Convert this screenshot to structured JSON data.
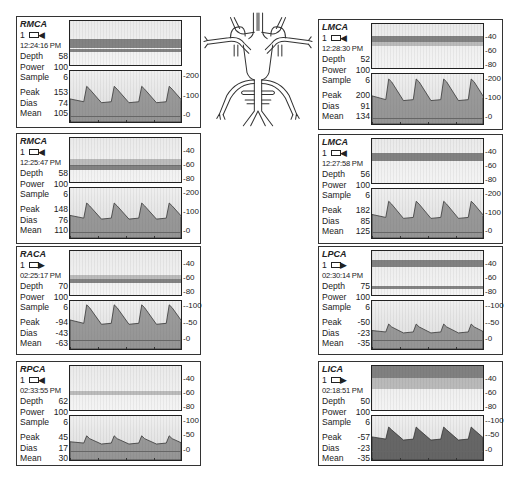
{
  "panels": [
    {
      "id": "rmca-1",
      "vessel": "RMCA",
      "channel": "1",
      "probe_direction": "toward",
      "time": "12:24:16 PM",
      "depth_label": "Depth",
      "depth": "58",
      "power_label": "Power",
      "power": "100",
      "sample_label": "Sample",
      "sample": "6",
      "peak_label": "Peak",
      "peak": "153",
      "dias_label": "Dias",
      "dias": "74",
      "mean_label": "Mean",
      "mean": "105",
      "depth_ticks": [],
      "velocity_ticks": [
        "200",
        "100",
        "0"
      ]
    },
    {
      "id": "rmca-2",
      "vessel": "RMCA",
      "channel": "1",
      "probe_direction": "toward",
      "time": "12:25:47 PM",
      "depth_label": "Depth",
      "depth": "58",
      "power_label": "Power",
      "power": "100",
      "sample_label": "Sample",
      "sample": "6",
      "peak_label": "Peak",
      "peak": "148",
      "dias_label": "Dias",
      "dias": "76",
      "mean_label": "Mean",
      "mean": "110",
      "depth_ticks": [
        "40",
        "60",
        "80"
      ],
      "velocity_ticks": [
        "200",
        "100",
        "0"
      ]
    },
    {
      "id": "raca",
      "vessel": "RACA",
      "channel": "1",
      "probe_direction": "away",
      "time": "02:25:17 PM",
      "depth_label": "Depth",
      "depth": "70",
      "power_label": "Power",
      "power": "100",
      "sample_label": "Sample",
      "sample": "6",
      "peak_label": "Peak",
      "peak": "-94",
      "dias_label": "Dias",
      "dias": "-43",
      "mean_label": "Mean",
      "mean": "-63",
      "depth_ticks": [
        "40",
        "60",
        "80"
      ],
      "velocity_ticks": [
        "-100",
        "-50",
        "0"
      ]
    },
    {
      "id": "rpca",
      "vessel": "RPCA",
      "channel": "1",
      "probe_direction": "toward",
      "time": "02:33:55 PM",
      "depth_label": "Depth",
      "depth": "62",
      "power_label": "Power",
      "power": "100",
      "sample_label": "Sample",
      "sample": "6",
      "peak_label": "Peak",
      "peak": "45",
      "dias_label": "Dias",
      "dias": "17",
      "mean_label": "Mean",
      "mean": "30",
      "depth_ticks": [
        "40",
        "60",
        "80"
      ],
      "velocity_ticks": [
        "100",
        "50",
        "0"
      ]
    },
    {
      "id": "lmca-1",
      "vessel": "LMCA",
      "channel": "1",
      "probe_direction": "toward",
      "time": "12:28:30 PM",
      "depth_label": "Depth",
      "depth": "52",
      "power_label": "Power",
      "power": "100",
      "sample_label": "Sample",
      "sample": "6",
      "peak_label": "Peak",
      "peak": "200",
      "dias_label": "Dias",
      "dias": "91",
      "mean_label": "Mean",
      "mean": "134",
      "depth_ticks": [
        "40",
        "60",
        "80"
      ],
      "velocity_ticks": [
        "200",
        "100",
        "0"
      ]
    },
    {
      "id": "lmca-2",
      "vessel": "LMCA",
      "channel": "1",
      "probe_direction": "toward",
      "time": "12:27:58 PM",
      "depth_label": "Depth",
      "depth": "56",
      "power_label": "Power",
      "power": "100",
      "sample_label": "Sample",
      "sample": "6",
      "peak_label": "Peak",
      "peak": "182",
      "dias_label": "Dias",
      "dias": "85",
      "mean_label": "Mean",
      "mean": "125",
      "depth_ticks": [
        "40",
        "60",
        "80"
      ],
      "velocity_ticks": [
        "200",
        "100",
        "0"
      ]
    },
    {
      "id": "lpca",
      "vessel": "LPCA",
      "channel": "1",
      "probe_direction": "away",
      "time": "02:30:14 PM",
      "depth_label": "Depth",
      "depth": "75",
      "power_label": "Power",
      "power": "100",
      "sample_label": "Sample",
      "sample": "6",
      "peak_label": "Peak",
      "peak": "-50",
      "dias_label": "Dias",
      "dias": "-23",
      "mean_label": "Mean",
      "mean": "-35",
      "depth_ticks": [
        "40",
        "60",
        "80"
      ],
      "velocity_ticks": [
        "-100",
        "-50",
        "0"
      ]
    },
    {
      "id": "lica",
      "vessel": "LICA",
      "channel": "1",
      "probe_direction": "away",
      "time": "02:18:51 PM",
      "depth_label": "Depth",
      "depth": "50",
      "power_label": "Power",
      "power": "100",
      "sample_label": "Sample",
      "sample": "6",
      "peak_label": "Peak",
      "peak": "-57",
      "dias_label": "Dias",
      "dias": "-23",
      "mean_label": "Mean",
      "mean": "-35",
      "depth_ticks": [
        "40",
        "60",
        "80"
      ],
      "velocity_ticks": [
        "-100",
        "-50",
        "0"
      ]
    }
  ],
  "diagram": {
    "name": "circle-of-willis"
  },
  "glyphs": {
    "arrow_toward": "◀",
    "arrow_away": "▶"
  }
}
